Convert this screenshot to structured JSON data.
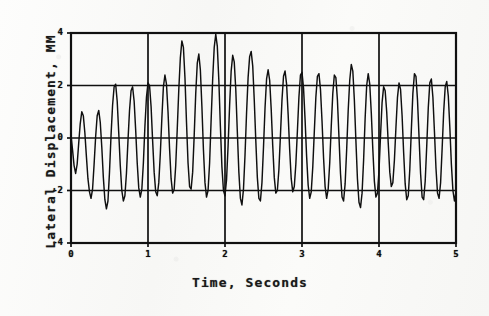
{
  "figure": {
    "background_color": "#fbfbfa",
    "ink_color": "#101010"
  },
  "axes": {
    "x_title": "Time, Seconds",
    "y_title": "Lateral Displacement, MM",
    "x_ticks": [
      "0",
      "1",
      "2",
      "3",
      "4",
      "5"
    ],
    "y_ticks": [
      "4",
      "2",
      "0",
      "-2",
      "-4"
    ]
  },
  "plot_geometry": {
    "left": 71,
    "right": 456,
    "top": 33,
    "bottom": 243
  },
  "chart_data": {
    "type": "line",
    "title": "",
    "xlabel": "Time, Seconds",
    "ylabel": "Lateral Displacement, MM",
    "xlim": [
      0,
      5
    ],
    "ylim": [
      -4,
      4
    ],
    "xticks": [
      0,
      1,
      2,
      3,
      4,
      5
    ],
    "yticks": [
      -4,
      -2,
      0,
      2,
      4
    ],
    "grid": true,
    "legend": null,
    "series": [
      {
        "name": "Lateral Displacement",
        "x": [
          0.0,
          0.02,
          0.04,
          0.06,
          0.08,
          0.1,
          0.12,
          0.14,
          0.16,
          0.18,
          0.2,
          0.22,
          0.24,
          0.26,
          0.28,
          0.3,
          0.32,
          0.34,
          0.36,
          0.38,
          0.4,
          0.42,
          0.44,
          0.46,
          0.48,
          0.5,
          0.52,
          0.54,
          0.56,
          0.58,
          0.6,
          0.62,
          0.64,
          0.66,
          0.68,
          0.7,
          0.72,
          0.74,
          0.76,
          0.78,
          0.8,
          0.82,
          0.84,
          0.86,
          0.88,
          0.9,
          0.92,
          0.94,
          0.96,
          0.98,
          1.0,
          1.02,
          1.04,
          1.06,
          1.08,
          1.1,
          1.12,
          1.14,
          1.16,
          1.18,
          1.2,
          1.22,
          1.24,
          1.26,
          1.28,
          1.3,
          1.32,
          1.34,
          1.36,
          1.38,
          1.4,
          1.42,
          1.44,
          1.46,
          1.48,
          1.5,
          1.52,
          1.54,
          1.56,
          1.58,
          1.6,
          1.62,
          1.64,
          1.66,
          1.68,
          1.7,
          1.72,
          1.74,
          1.76,
          1.78,
          1.8,
          1.82,
          1.84,
          1.86,
          1.88,
          1.9,
          1.92,
          1.94,
          1.96,
          1.98,
          2.0,
          2.02,
          2.04,
          2.06,
          2.08,
          2.1,
          2.12,
          2.14,
          2.16,
          2.18,
          2.2,
          2.22,
          2.24,
          2.26,
          2.28,
          2.3,
          2.32,
          2.34,
          2.36,
          2.38,
          2.4,
          2.42,
          2.44,
          2.46,
          2.48,
          2.5,
          2.52,
          2.54,
          2.56,
          2.58,
          2.6,
          2.62,
          2.64,
          2.66,
          2.68,
          2.7,
          2.72,
          2.74,
          2.76,
          2.78,
          2.8,
          2.82,
          2.84,
          2.86,
          2.88,
          2.9,
          2.92,
          2.94,
          2.96,
          2.98,
          3.0,
          3.02,
          3.04,
          3.06,
          3.08,
          3.1,
          3.12,
          3.14,
          3.16,
          3.18,
          3.2,
          3.22,
          3.24,
          3.26,
          3.28,
          3.3,
          3.32,
          3.34,
          3.36,
          3.38,
          3.4,
          3.42,
          3.44,
          3.46,
          3.48,
          3.5,
          3.52,
          3.54,
          3.56,
          3.58,
          3.6,
          3.62,
          3.64,
          3.66,
          3.68,
          3.7,
          3.72,
          3.74,
          3.76,
          3.78,
          3.8,
          3.82,
          3.84,
          3.86,
          3.88,
          3.9,
          3.92,
          3.94,
          3.96,
          3.98,
          4.0,
          4.02,
          4.04,
          4.06,
          4.08,
          4.1,
          4.12,
          4.14,
          4.16,
          4.18,
          4.2,
          4.22,
          4.24,
          4.26,
          4.28,
          4.3,
          4.32,
          4.34,
          4.36,
          4.38,
          4.4,
          4.42,
          4.44,
          4.46,
          4.48,
          4.5,
          4.52,
          4.54,
          4.56,
          4.58,
          4.6,
          4.62,
          4.64,
          4.66,
          4.68,
          4.7,
          4.72,
          4.74,
          4.76,
          4.78,
          4.8,
          4.82,
          4.84,
          4.86,
          4.88,
          4.9,
          4.92,
          4.94,
          4.96,
          4.98,
          5.0
        ],
        "y": [
          0.1,
          -0.45,
          -1.05,
          -1.35,
          -1.0,
          -0.2,
          0.55,
          1.0,
          0.85,
          0.2,
          -0.7,
          -1.55,
          -2.05,
          -2.3,
          -1.95,
          -1.0,
          0.05,
          0.85,
          1.05,
          0.6,
          -0.35,
          -1.5,
          -2.35,
          -2.7,
          -2.4,
          -1.3,
          0.1,
          1.25,
          1.95,
          2.05,
          1.4,
          0.2,
          -1.05,
          -2.0,
          -2.4,
          -2.2,
          -1.35,
          -0.1,
          1.05,
          1.8,
          1.95,
          1.4,
          0.3,
          -0.95,
          -1.9,
          -2.25,
          -1.95,
          -0.95,
          0.45,
          1.55,
          2.1,
          2.0,
          1.2,
          -0.1,
          -1.3,
          -2.05,
          -2.2,
          -1.7,
          -0.6,
          0.75,
          1.95,
          2.4,
          2.05,
          1.0,
          -0.4,
          -1.55,
          -2.1,
          -1.95,
          -1.05,
          0.35,
          1.85,
          3.05,
          3.7,
          3.45,
          2.3,
          0.6,
          -0.95,
          -1.85,
          -1.95,
          -1.3,
          0.1,
          1.7,
          2.85,
          3.2,
          2.6,
          1.2,
          -0.45,
          -1.7,
          -2.25,
          -2.0,
          -0.95,
          0.7,
          2.25,
          3.45,
          3.95,
          3.5,
          2.2,
          0.45,
          -1.1,
          -2.0,
          -2.2,
          -1.6,
          -0.3,
          1.25,
          2.55,
          3.15,
          2.9,
          1.85,
          0.25,
          -1.3,
          -2.3,
          -2.55,
          -1.95,
          -0.65,
          0.95,
          2.3,
          3.1,
          3.3,
          2.75,
          1.45,
          -0.1,
          -1.5,
          -2.3,
          -2.4,
          -1.7,
          -0.35,
          1.15,
          2.25,
          2.6,
          2.2,
          1.1,
          -0.3,
          -1.5,
          -2.1,
          -2.0,
          -1.2,
          0.1,
          1.45,
          2.35,
          2.55,
          2.05,
          0.9,
          -0.45,
          -1.55,
          -2.05,
          -1.85,
          -1.0,
          0.25,
          1.55,
          2.4,
          2.5,
          1.9,
          0.7,
          -0.7,
          -1.8,
          -2.3,
          -2.05,
          -1.1,
          0.25,
          1.55,
          2.35,
          2.45,
          1.85,
          0.65,
          -0.75,
          -1.85,
          -2.3,
          -1.95,
          -0.95,
          0.45,
          1.7,
          2.4,
          2.3,
          1.45,
          0.05,
          -1.35,
          -2.25,
          -2.4,
          -1.75,
          -0.45,
          1.05,
          2.2,
          2.8,
          2.55,
          1.45,
          -0.1,
          -1.55,
          -2.45,
          -2.65,
          -2.1,
          -0.85,
          0.75,
          2.0,
          2.45,
          2.05,
          0.95,
          -0.45,
          -1.65,
          -2.25,
          -2.1,
          -1.25,
          0.1,
          1.35,
          1.95,
          1.8,
          1.0,
          -0.2,
          -1.3,
          -1.85,
          -1.7,
          -0.85,
          0.4,
          1.55,
          2.1,
          1.85,
          0.85,
          -0.55,
          -1.75,
          -2.35,
          -2.2,
          -1.2,
          0.3,
          1.7,
          2.45,
          2.35,
          1.45,
          0.05,
          -1.35,
          -2.25,
          -2.35,
          -1.65,
          -0.3,
          1.15,
          2.1,
          2.25,
          1.55,
          0.25,
          -1.15,
          -2.1,
          -2.3,
          -1.7,
          -0.4,
          1.0,
          1.95,
          2.15,
          1.6,
          0.4,
          -1.0,
          -2.0,
          -2.4,
          -2.05
        ]
      }
    ]
  }
}
